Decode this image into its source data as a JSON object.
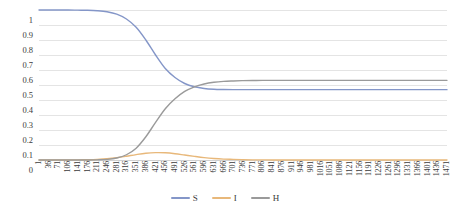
{
  "chart_data": {
    "type": "line",
    "title": "",
    "subtitle": "",
    "xlabel": "",
    "ylabel": "",
    "xlim": [
      1,
      1471
    ],
    "ylim": [
      0,
      1
    ],
    "grid": true,
    "legend_position": "bottom",
    "y_ticks": [
      "0",
      "0.1",
      "0.2",
      "0.3",
      "0.4",
      "0.5",
      "0.6",
      "0.7",
      "0.8",
      "0.9",
      "1"
    ],
    "y_tick_values": [
      0,
      0.1,
      0.2,
      0.3,
      0.4,
      0.5,
      0.6,
      0.7,
      0.8,
      0.9,
      1
    ],
    "categories": [
      1,
      36,
      71,
      106,
      141,
      176,
      211,
      246,
      281,
      316,
      351,
      386,
      421,
      456,
      491,
      526,
      561,
      596,
      631,
      666,
      701,
      736,
      771,
      806,
      841,
      876,
      911,
      946,
      981,
      1016,
      1051,
      1086,
      1121,
      1156,
      1191,
      1226,
      1261,
      1296,
      1331,
      1366,
      1401,
      1436,
      1471
    ],
    "series": [
      {
        "name": "S",
        "color": "#8496c8",
        "values": [
          1.0,
          1.0,
          1.0,
          1.0,
          0.999,
          0.998,
          0.995,
          0.988,
          0.972,
          0.94,
          0.885,
          0.8,
          0.7,
          0.61,
          0.55,
          0.51,
          0.488,
          0.477,
          0.472,
          0.47,
          0.469,
          0.469,
          0.469,
          0.469,
          0.469,
          0.469,
          0.469,
          0.469,
          0.469,
          0.469,
          0.469,
          0.469,
          0.469,
          0.469,
          0.469,
          0.469,
          0.469,
          0.469,
          0.469,
          0.469,
          0.469,
          0.469,
          0.469
        ]
      },
      {
        "name": "I",
        "color": "#e8b87a",
        "values": [
          0.0,
          0.0,
          0.0,
          0.0,
          0.001,
          0.002,
          0.004,
          0.008,
          0.015,
          0.025,
          0.036,
          0.045,
          0.049,
          0.048,
          0.042,
          0.033,
          0.024,
          0.016,
          0.01,
          0.006,
          0.004,
          0.002,
          0.001,
          0.001,
          0.0,
          0.0,
          0.0,
          0.0,
          0.0,
          0.0,
          0.0,
          0.0,
          0.0,
          0.0,
          0.0,
          0.0,
          0.0,
          0.0,
          0.0,
          0.0,
          0.0,
          0.0,
          0.0
        ]
      },
      {
        "name": "H",
        "color": "#9a9a9a",
        "values": [
          0.0,
          0.0,
          0.0,
          0.0,
          0.0,
          0.0,
          0.001,
          0.004,
          0.013,
          0.035,
          0.079,
          0.155,
          0.251,
          0.342,
          0.408,
          0.457,
          0.488,
          0.507,
          0.518,
          0.524,
          0.527,
          0.529,
          0.53,
          0.531,
          0.531,
          0.531,
          0.531,
          0.531,
          0.531,
          0.531,
          0.531,
          0.531,
          0.531,
          0.531,
          0.531,
          0.531,
          0.531,
          0.531,
          0.531,
          0.531,
          0.531,
          0.531,
          0.531
        ]
      }
    ]
  },
  "legend": {
    "items": [
      {
        "label": "S",
        "color": "#8496c8"
      },
      {
        "label": "I",
        "color": "#e8b87a"
      },
      {
        "label": "H",
        "color": "#9a9a9a"
      }
    ]
  },
  "colors": {
    "series_s": "#8496c8",
    "series_i": "#e8b87a",
    "series_h": "#9a9a9a",
    "gridline": "#e4e4e4",
    "text": "#3b3b3b",
    "background": "#ffffff"
  }
}
